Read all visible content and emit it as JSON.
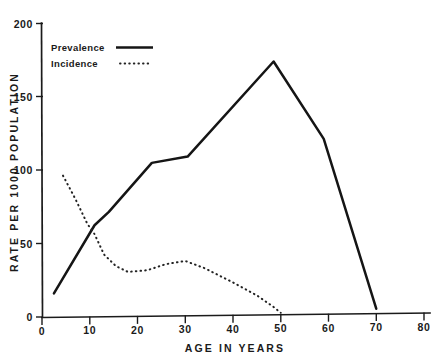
{
  "chart_data": {
    "type": "line",
    "title": "",
    "xlabel": "AGE IN YEARS",
    "ylabel": "RATE PER 1000 POPULATION",
    "xlim": [
      0,
      80
    ],
    "ylim": [
      0,
      200
    ],
    "xticks": [
      0,
      10,
      20,
      30,
      40,
      50,
      60,
      70,
      80
    ],
    "yticks": [
      0,
      50,
      100,
      150,
      200
    ],
    "xtick_labels": [
      "0",
      "10",
      "20",
      "30",
      "40",
      "50",
      "60",
      "70",
      "80"
    ],
    "ytick_labels": [
      "0",
      "50",
      "100",
      "150",
      "200"
    ],
    "grid": false,
    "legend_position": "top-left",
    "series": [
      {
        "name": "Prevalence",
        "style": "solid",
        "color": "#151515",
        "points": [
          [
            2.5,
            16
          ],
          [
            11.0,
            62
          ],
          [
            14.0,
            71
          ],
          [
            23.0,
            104
          ],
          [
            30.5,
            108
          ],
          [
            48.5,
            172
          ],
          [
            59.0,
            119
          ],
          [
            70.0,
            3
          ]
        ]
      },
      {
        "name": "Incidence",
        "style": "dotted",
        "color": "#232323",
        "points": [
          [
            4.4,
            96
          ],
          [
            7.0,
            80
          ],
          [
            9.5,
            63
          ],
          [
            11.0,
            56
          ],
          [
            13.0,
            42
          ],
          [
            15.5,
            34
          ],
          [
            18.0,
            30
          ],
          [
            22.0,
            31
          ],
          [
            26.0,
            35
          ],
          [
            30.0,
            37
          ],
          [
            34.0,
            32
          ],
          [
            40.0,
            22
          ],
          [
            45.0,
            13
          ],
          [
            48.5,
            5
          ],
          [
            50.0,
            1
          ]
        ]
      }
    ]
  },
  "legend": {
    "entries": [
      {
        "label": "Prevalence",
        "style": "solid"
      },
      {
        "label": "Incidence",
        "style": "dotted"
      }
    ]
  }
}
